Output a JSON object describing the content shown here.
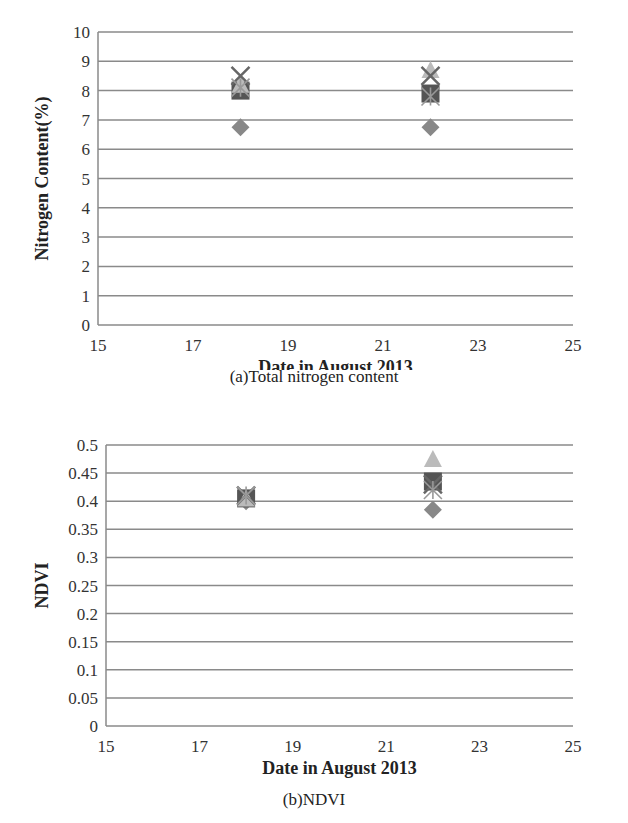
{
  "chart_data": [
    {
      "type": "scatter",
      "id": "a",
      "title": "",
      "caption": "(a)Total nitrogen content",
      "xlabel": "Date in August 2013",
      "ylabel": "Nitrogen Content(%)",
      "xlim": [
        15,
        25
      ],
      "xticks": [
        15,
        17,
        19,
        21,
        23,
        25
      ],
      "ylim": [
        0,
        10
      ],
      "yticks": [
        0,
        1,
        2,
        3,
        4,
        5,
        6,
        7,
        8,
        9,
        10
      ],
      "grid": "horizontal",
      "legend": "none",
      "series": [
        {
          "name": "diamond",
          "marker": "diamond",
          "color": "#888888",
          "x": [
            18,
            22
          ],
          "y": [
            6.75,
            6.75
          ]
        },
        {
          "name": "square",
          "marker": "square",
          "color": "#555555",
          "x": [
            18,
            22
          ],
          "y": [
            8.0,
            7.9
          ]
        },
        {
          "name": "triangle",
          "marker": "triangle",
          "color": "#bbbbbb",
          "x": [
            18,
            22
          ],
          "y": [
            8.2,
            8.7
          ]
        },
        {
          "name": "x",
          "marker": "x",
          "color": "#666666",
          "x": [
            18,
            22
          ],
          "y": [
            8.5,
            8.5
          ]
        },
        {
          "name": "asterisk",
          "marker": "asterisk",
          "color": "#999999",
          "x": [
            18,
            22
          ],
          "y": [
            8.1,
            7.8
          ]
        }
      ]
    },
    {
      "type": "scatter",
      "id": "b",
      "title": "",
      "caption": "(b)NDVI",
      "xlabel": "Date in August 2013",
      "ylabel": "NDVI",
      "xlim": [
        15,
        25
      ],
      "xticks": [
        15,
        17,
        19,
        21,
        23,
        25
      ],
      "ylim": [
        0,
        0.5
      ],
      "yticks": [
        0,
        0.05,
        0.1,
        0.15,
        0.2,
        0.25,
        0.3,
        0.35,
        0.4,
        0.45,
        0.5
      ],
      "grid": "horizontal",
      "legend": "none",
      "series": [
        {
          "name": "diamond",
          "marker": "diamond",
          "color": "#888888",
          "x": [
            18,
            22
          ],
          "y": [
            0.4,
            0.385
          ]
        },
        {
          "name": "square",
          "marker": "square",
          "color": "#555555",
          "x": [
            18,
            22
          ],
          "y": [
            0.405,
            0.435
          ]
        },
        {
          "name": "triangle",
          "marker": "triangle",
          "color": "#bbbbbb",
          "x": [
            18,
            22
          ],
          "y": [
            0.405,
            0.475
          ]
        },
        {
          "name": "x",
          "marker": "x",
          "color": "#666666",
          "x": [
            18,
            22
          ],
          "y": [
            0.41,
            0.43
          ]
        },
        {
          "name": "asterisk",
          "marker": "asterisk",
          "color": "#999999",
          "x": [
            18,
            22
          ],
          "y": [
            0.41,
            0.42
          ]
        }
      ]
    }
  ]
}
